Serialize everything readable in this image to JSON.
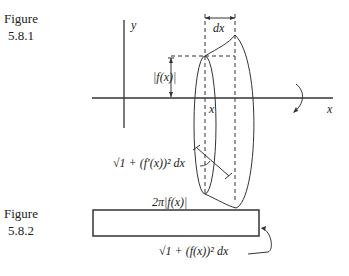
{
  "figure1": {
    "caption_word": "Figure",
    "caption_number": "5.8.1",
    "labels": {
      "y_axis": "y",
      "x_axis": "x",
      "dx": "dx",
      "fx": "|f(x)|",
      "x_point": "x",
      "arc_length": "√1 + (f′(x))² dx"
    }
  },
  "figure2": {
    "caption_word": "Figure",
    "caption_number": "5.8.2",
    "labels": {
      "width": "2π|f(x)|",
      "height": "√1 + (f(x))² dx"
    }
  }
}
